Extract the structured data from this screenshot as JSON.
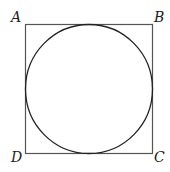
{
  "diagram": {
    "type": "inscribed-circle-in-square",
    "labels": {
      "top_left": "A",
      "top_right": "B",
      "bottom_right": "C",
      "bottom_left": "D"
    },
    "colors": {
      "stroke": "#3a3a3a",
      "background": "#ffffff"
    }
  }
}
